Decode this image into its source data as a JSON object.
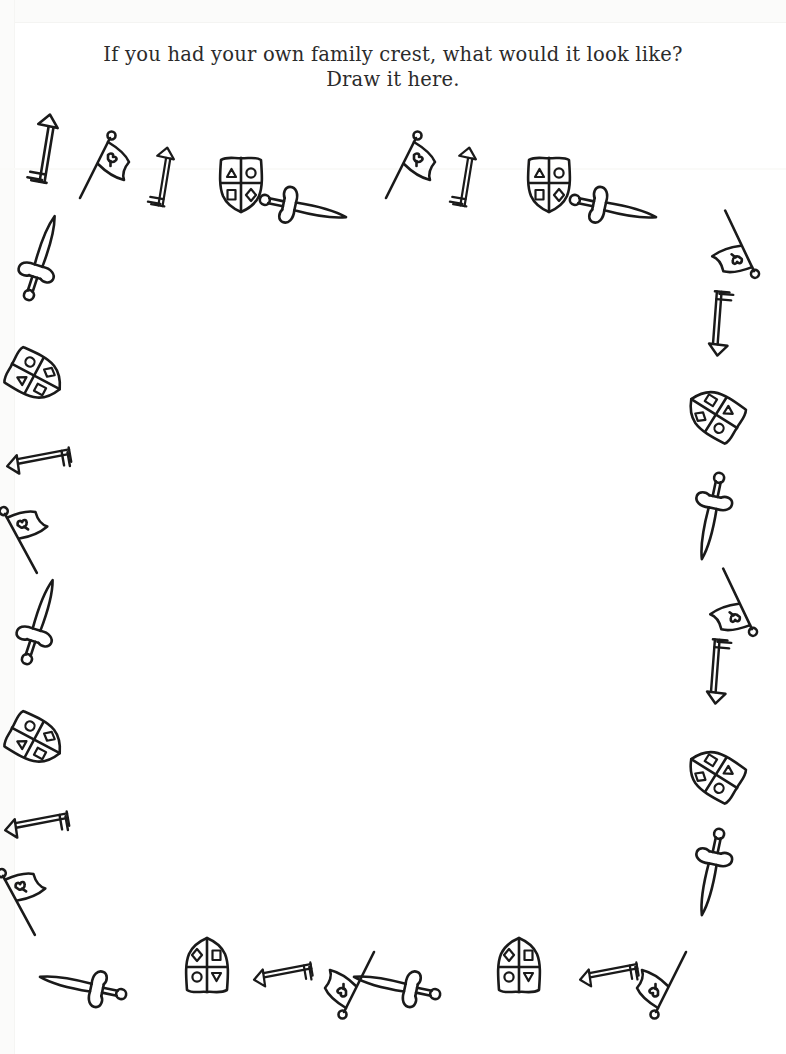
{
  "page": {
    "width": 786,
    "height": 1054,
    "background_color": "#ffffff",
    "ink_color": "#1a1a1a",
    "title_color": "#2b2b2b"
  },
  "worksheet": {
    "prompt_line_1": "If you had your own family crest, what would it look like?",
    "prompt_line_2": "Draw it here.",
    "drawing_area_label": ""
  },
  "icon_legend": {
    "arrow": "arrow-icon",
    "banner": "banner-flag-icon",
    "shield": "heraldic-shield-icon",
    "sword": "sword-icon"
  },
  "shield_charges": {
    "top_left": "triangle",
    "top_right": "circle",
    "bottom_left": "square",
    "bottom_right": "diamond"
  },
  "border_decorations": [
    {
      "type": "arrow",
      "x": 12,
      "y": 118,
      "rot": -35,
      "scale": 1.0
    },
    {
      "type": "banner",
      "x": 72,
      "y": 128,
      "rot": 0,
      "scale": 1.0
    },
    {
      "type": "arrow",
      "x": 130,
      "y": 146,
      "rot": -35,
      "scale": 0.86
    },
    {
      "type": "shield",
      "x": 214,
      "y": 152,
      "rot": 0,
      "scale": 1.0
    },
    {
      "type": "sword",
      "x": 278,
      "y": 158,
      "rot": 102,
      "scale": 1.0
    },
    {
      "type": "banner",
      "x": 378,
      "y": 128,
      "rot": 0,
      "scale": 1.0
    },
    {
      "type": "arrow",
      "x": 432,
      "y": 146,
      "rot": -35,
      "scale": 0.86
    },
    {
      "type": "shield",
      "x": 522,
      "y": 152,
      "rot": 0,
      "scale": 1.0
    },
    {
      "type": "sword",
      "x": 588,
      "y": 158,
      "rot": 102,
      "scale": 1.0
    },
    {
      "type": "banner",
      "x": 706,
      "y": 212,
      "rot": 128,
      "scale": 1.0
    },
    {
      "type": "arrow",
      "x": 686,
      "y": 288,
      "rot": 140,
      "scale": 0.94
    },
    {
      "type": "shield",
      "x": 688,
      "y": 382,
      "rot": 122,
      "scale": 1.0
    },
    {
      "type": "sword",
      "x": 686,
      "y": 466,
      "rot": 192,
      "scale": 1.0
    },
    {
      "type": "banner",
      "x": 704,
      "y": 570,
      "rot": 128,
      "scale": 1.0
    },
    {
      "type": "arrow",
      "x": 684,
      "y": 636,
      "rot": 140,
      "scale": 0.94
    },
    {
      "type": "shield",
      "x": 688,
      "y": 742,
      "rot": 122,
      "scale": 1.0
    },
    {
      "type": "sword",
      "x": 686,
      "y": 822,
      "rot": 192,
      "scale": 1.0
    },
    {
      "type": "sword",
      "x": 16,
      "y": 208,
      "rot": 18,
      "scale": 1.0
    },
    {
      "type": "shield",
      "x": 8,
      "y": 344,
      "rot": 298,
      "scale": 1.0
    },
    {
      "type": "arrow",
      "x": 8,
      "y": 426,
      "rot": 215,
      "scale": 0.94
    },
    {
      "type": "banner",
      "x": -8,
      "y": 498,
      "rot": 305,
      "scale": 1.0
    },
    {
      "type": "sword",
      "x": 14,
      "y": 572,
      "rot": 18,
      "scale": 1.0
    },
    {
      "type": "shield",
      "x": 8,
      "y": 708,
      "rot": 298,
      "scale": 1.0
    },
    {
      "type": "arrow",
      "x": 6,
      "y": 790,
      "rot": 215,
      "scale": 0.94
    },
    {
      "type": "banner",
      "x": -10,
      "y": 860,
      "rot": 305,
      "scale": 1.0
    },
    {
      "type": "sword",
      "x": 58,
      "y": 936,
      "rot": 282,
      "scale": 1.0
    },
    {
      "type": "shield",
      "x": 180,
      "y": 934,
      "rot": 180,
      "scale": 1.0
    },
    {
      "type": "arrow",
      "x": 252,
      "y": 940,
      "rot": 215,
      "scale": 0.86
    },
    {
      "type": "banner",
      "x": 320,
      "y": 948,
      "rot": 180,
      "scale": 1.0
    },
    {
      "type": "sword",
      "x": 372,
      "y": 936,
      "rot": 282,
      "scale": 1.0
    },
    {
      "type": "shield",
      "x": 492,
      "y": 934,
      "rot": 180,
      "scale": 1.0
    },
    {
      "type": "arrow",
      "x": 578,
      "y": 940,
      "rot": 215,
      "scale": 0.86
    },
    {
      "type": "banner",
      "x": 632,
      "y": 948,
      "rot": 180,
      "scale": 1.0
    }
  ]
}
